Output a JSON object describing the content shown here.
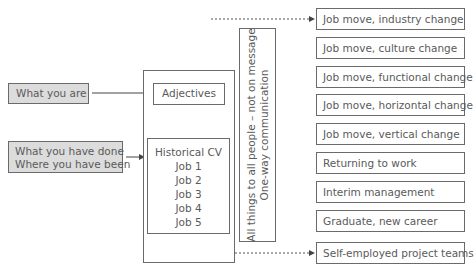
{
  "left": {
    "what_you_are": "What you are",
    "what_you_have_done": "What you have done\nWhere you have been"
  },
  "cv": {
    "adjectives": "Adjectives",
    "historical": "Historical CV\nJob 1\nJob 2\nJob 3\nJob 4\nJob 5"
  },
  "vertical_note": "All things to all people – not on message\nOne-way communication",
  "right_items": [
    "Job move, industry change",
    "Job move, culture change",
    "Job move, functional change",
    "Job move, horizontal change",
    "Job move, vertical change",
    "Returning to work",
    "Interim management",
    "Graduate, new career",
    "Self-employed project teams"
  ]
}
